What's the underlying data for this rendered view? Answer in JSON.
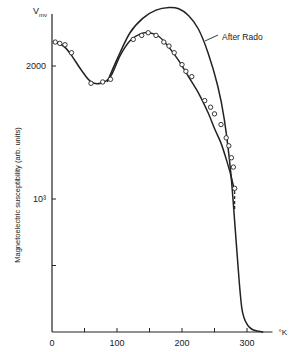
{
  "chart_data": {
    "type": "line",
    "title": "",
    "xlabel": "°K",
    "ylabel": "Magnetoelectric susceptibility (arb. units)",
    "y_unit_label": "V_mv",
    "xlim": [
      0,
      330
    ],
    "ylim": [
      0,
      2500
    ],
    "x_ticks": [
      0,
      50,
      100,
      150,
      200,
      250,
      300
    ],
    "x_tick_labels": [
      "0",
      "",
      "100",
      "",
      "200",
      "",
      "300"
    ],
    "y_ticks": [
      500,
      1000,
      2000
    ],
    "y_tick_labels": [
      "",
      "10³",
      "2000"
    ],
    "grid": false,
    "annotations": [
      {
        "text": "After Rado",
        "x": 220,
        "y": 2420
      }
    ],
    "series": [
      {
        "name": "After Rado",
        "kind": "line",
        "x": [
          85,
          100,
          120,
          140,
          160,
          180,
          195,
          210,
          225,
          240,
          255,
          265,
          275,
          283,
          288,
          292,
          296,
          300,
          304,
          310,
          318,
          325
        ],
        "y": [
          1880,
          2050,
          2250,
          2360,
          2420,
          2440,
          2430,
          2380,
          2280,
          2100,
          1850,
          1600,
          1200,
          700,
          380,
          180,
          100,
          60,
          35,
          15,
          5,
          0
        ]
      },
      {
        "name": "Fit curve",
        "kind": "line",
        "x": [
          2,
          10,
          20,
          30,
          45,
          60,
          75,
          90,
          105,
          120,
          135,
          150,
          165,
          180,
          195,
          210,
          225,
          240,
          250,
          260,
          268,
          274,
          278,
          280
        ],
        "y": [
          2180,
          2170,
          2140,
          2080,
          1970,
          1880,
          1870,
          1920,
          2080,
          2190,
          2240,
          2250,
          2220,
          2140,
          2040,
          1920,
          1800,
          1650,
          1530,
          1420,
          1300,
          1200,
          1120,
          1080
        ]
      },
      {
        "name": "Measured",
        "kind": "scatter",
        "x": [
          5,
          12,
          20,
          30,
          60,
          78,
          90,
          125,
          138,
          148,
          160,
          172,
          180,
          188,
          200,
          206,
          215,
          235,
          244,
          250,
          260,
          268,
          272,
          276,
          279,
          281
        ],
        "y": [
          2180,
          2170,
          2160,
          2100,
          1870,
          1880,
          1900,
          2200,
          2230,
          2250,
          2230,
          2180,
          2150,
          2100,
          2010,
          1960,
          1920,
          1740,
          1690,
          1640,
          1560,
          1460,
          1400,
          1310,
          1240,
          1080
        ]
      }
    ],
    "dashed_tail": {
      "x": [
        281,
        281
      ],
      "y": [
        1060,
        920
      ]
    }
  },
  "layout": {
    "origin_px": [
      52,
      332
    ],
    "px_per_x": 0.65,
    "px_per_y": 0.133,
    "line_color": "#222222"
  }
}
